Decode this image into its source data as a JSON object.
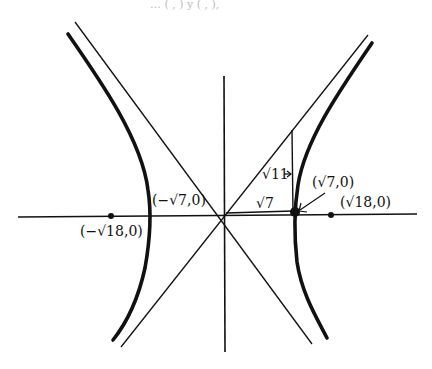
{
  "figure": {
    "type": "hyperbola-sketch",
    "top_fragment": "… (   ,  ) y  (   ,  ),",
    "labels": {
      "left_vertex": "(−√7,0)",
      "right_vertex": "(√7,0)",
      "left_focus": "(−√18,0)",
      "right_focus": "(√18,0)",
      "triangle_base": "√7",
      "triangle_height": "√11"
    },
    "geometry": {
      "center": [
        224,
        216
      ],
      "vertex_x": [
        149,
        296
      ],
      "focus_x": [
        111,
        331
      ],
      "ink_color": "#111111"
    }
  }
}
